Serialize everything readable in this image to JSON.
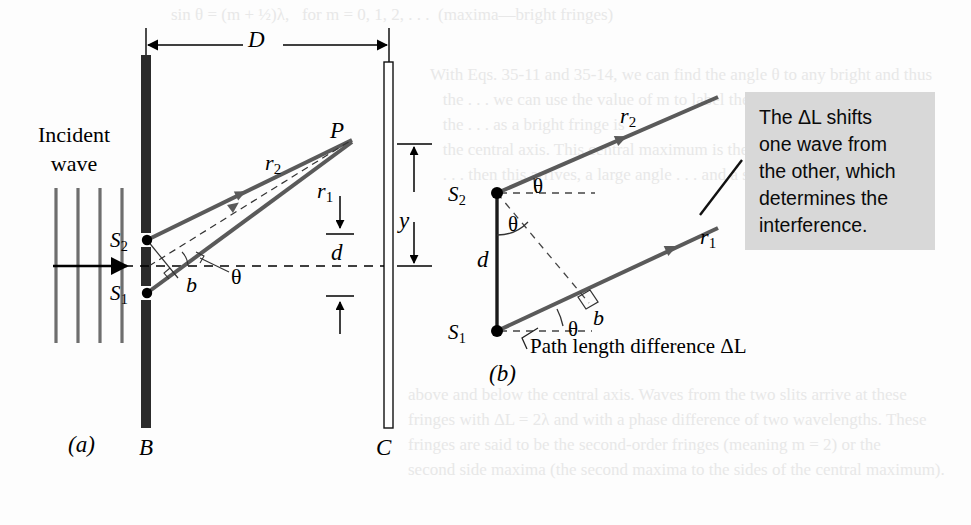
{
  "figure": {
    "domain": "physics-optics-double-slit",
    "background_color": "#fdfdfd",
    "ink_color": "#000000",
    "ray_color": "#5a5a5a",
    "barrier_color": "#2b2b2b",
    "wavefront_color": "#6e6e6e",
    "callout_background": "#d8d8d8"
  },
  "callout": {
    "text": "The ΔL shifts\none wave from\nthe other, which\ndetermines the\ninterference."
  },
  "panel_a": {
    "caption": "(a)",
    "incident_label": "Incident\nwave",
    "distance_label": "D",
    "point_label": "P",
    "ray_far_label": "r",
    "ray_far_sub": "2",
    "ray_near_label": "r",
    "ray_near_sub": "1",
    "height_label": "y",
    "slit_separation_label": "d",
    "slit_top_label": "S",
    "slit_top_sub": "2",
    "slit_bottom_label": "S",
    "slit_bottom_sub": "1",
    "path_segment_label": "b",
    "angle_label": "θ",
    "barrier_label": "B",
    "screen_label": "C",
    "wavefront_count": 4
  },
  "panel_b": {
    "caption": "(b)",
    "slit_top_label": "S",
    "slit_top_sub": "2",
    "slit_bottom_label": "S",
    "slit_bottom_sub": "1",
    "ray_far_label": "r",
    "ray_far_sub": "2",
    "ray_near_label": "r",
    "ray_near_sub": "1",
    "slit_separation_label": "d",
    "angle_label_top": "θ",
    "angle_label_mid": "θ",
    "angle_label_bottom": "θ",
    "path_segment_label": "b",
    "path_difference_label": "Path length difference ΔL"
  },
  "bleed_through": {
    "top": "            sin θ = (m + ½)λ,   for m = 0, 1, 2, . . .  (maxima—bright fringes)",
    "middle": "With Eqs. 35-11 and 35-14, we can find the angle θ to any bright and thus\n   the . . . we can use the value of m to label the fringes. For\n   the . . . as a bright fringe is\n   the central axis. This central maximum is the point at which waves\n   . . . then this arrives, a large angle . . . and a small . . .",
    "bottom": "above and below the central axis. Waves from the two slits arrive at these\nfringes with ΔL = 2λ and with a phase difference of two wavelengths. These\nfringes are said to be the second-order fringes (meaning m = 2) or the\nsecond side maxima (the second maxima to the sides of the central maximum)."
  }
}
